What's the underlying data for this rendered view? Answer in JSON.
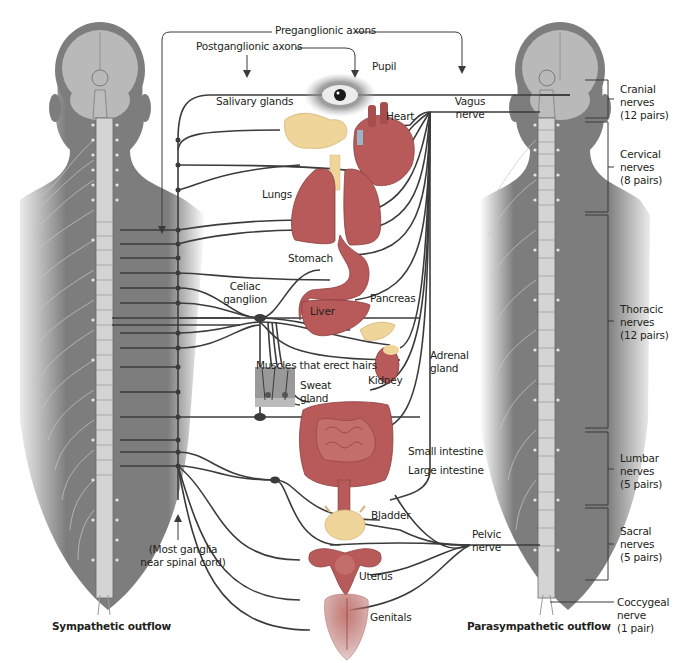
{
  "colors": {
    "body_silhouette": "#7d7d7d",
    "brain": "#b9b9b9",
    "spinal_cord": "#d4d4d4",
    "nerve_line": "#3b3b3b",
    "organ_red": "#b85a5a",
    "organ_pink": "#e3a7a3",
    "organ_yellow": "#efd59a",
    "text": "#231f20"
  },
  "headers": {
    "preganglionic": "Preganglionic axons",
    "postganglionic": "Postganglionic axons"
  },
  "organs": {
    "pupil": "Pupil",
    "salivary": "Salivary glands",
    "heart": "Heart",
    "lungs": "Lungs",
    "stomach": "Stomach",
    "liver": "Liver",
    "pancreas": "Pancreas",
    "muscles_hairs": "Muscles that erect hairs",
    "sweat_gland_1": "Sweat",
    "sweat_gland_2": "gland",
    "kidney": "Kidney",
    "adrenal_1": "Adrenal",
    "adrenal_2": "gland",
    "small_intestine": "Small intestine",
    "large_intestine": "Large intestine",
    "bladder": "Bladder",
    "uterus": "Uterus",
    "genitals": "Genitals"
  },
  "ganglia": {
    "celiac_1": "Celiac",
    "celiac_2": "ganglion",
    "most_ganglia_1": "(Most ganglia",
    "most_ganglia_2": "near spinal cord)"
  },
  "nerves": {
    "vagus_1": "Vagus",
    "vagus_2": "nerve",
    "pelvic_1": "Pelvic",
    "pelvic_2": "nerve"
  },
  "spinal_regions": [
    {
      "name": "Cranial",
      "line2": "nerves",
      "line3": "(12 pairs)"
    },
    {
      "name": "Cervical",
      "line2": "nerves",
      "line3": "(8 pairs)"
    },
    {
      "name": "Thoracic",
      "line2": "nerves",
      "line3": "(12 pairs)"
    },
    {
      "name": "Lumbar",
      "line2": "nerves",
      "line3": "(5 pairs)"
    },
    {
      "name": "Sacral",
      "line2": "nerves",
      "line3": "(5 pairs)"
    },
    {
      "name": "Coccygeal",
      "line2": "nerve",
      "line3": "(1 pair)"
    }
  ],
  "captions": {
    "sympathetic": "Sympathetic outflow",
    "parasympathetic": "Parasympathetic outflow"
  }
}
